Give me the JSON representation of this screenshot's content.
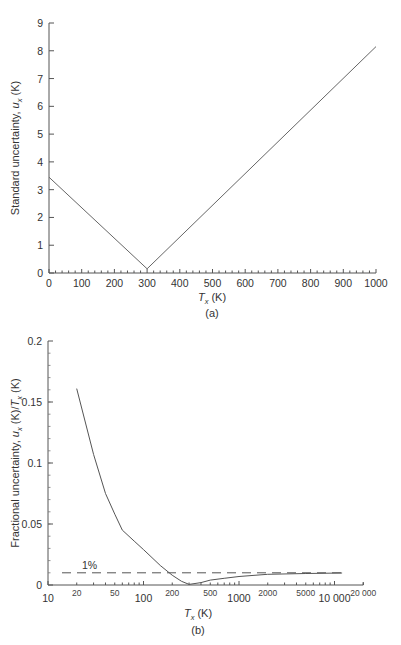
{
  "chart_data": [
    {
      "id": "a",
      "type": "line",
      "title": "",
      "caption": "(a)",
      "xlabel": "T_x (K)",
      "xlabel_var": "T",
      "xlabel_sub": "x",
      "xlabel_unit": " (K)",
      "ylabel": "Standard uncertainty, u_x (K)",
      "ylabel_prefix": "Standard uncertainty, ",
      "ylabel_var": "u",
      "ylabel_sub": "x",
      "ylabel_unit": " (K)",
      "xscale": "linear",
      "xlim": [
        0,
        1000
      ],
      "ylim": [
        0,
        9
      ],
      "xticks": [
        0,
        100,
        200,
        300,
        400,
        500,
        600,
        700,
        800,
        900,
        1000
      ],
      "yticks": [
        0,
        1,
        2,
        3,
        4,
        5,
        6,
        7,
        8,
        9
      ],
      "grid": false,
      "legend": null,
      "series": [
        {
          "name": "u_x",
          "x": [
            0,
            300,
            1000
          ],
          "y": [
            3.45,
            0.15,
            8.15
          ]
        }
      ]
    },
    {
      "id": "b",
      "type": "line",
      "title": "",
      "caption": "(b)",
      "xlabel": "T_x (K)",
      "xlabel_var": "T",
      "xlabel_sub": "x",
      "xlabel_unit": " (K)",
      "ylabel": "Fractional uncertainty, u_x (K)/T_x (K)",
      "ylabel_prefix": "Fractional uncertainty, ",
      "ylabel_var1": "u",
      "ylabel_sub1": "x",
      "ylabel_mid": " (K)/",
      "ylabel_var2": "T",
      "ylabel_sub2": "x",
      "ylabel_unit": " (K)",
      "xscale": "log",
      "xlim": [
        10,
        20000
      ],
      "ylim": [
        0,
        0.2
      ],
      "xticks_major": [
        10,
        100,
        1000,
        10000
      ],
      "xticks_major_labels": [
        "10",
        "100",
        "1000",
        "10 000"
      ],
      "xticks_minor_labeled": [
        20,
        50,
        200,
        500,
        2000,
        5000,
        20000
      ],
      "xticks_minor_labels": [
        "20",
        "50",
        "200",
        "500",
        "2000",
        "5000",
        "20 000"
      ],
      "yticks": [
        0,
        0.05,
        0.1,
        0.15,
        0.2
      ],
      "ytick_labels": [
        "0",
        "0.05",
        "0.1",
        "0.15",
        "0.2"
      ],
      "grid": false,
      "legend": null,
      "annotations": [
        {
          "text": "1%",
          "type": "hline",
          "y": 0.01,
          "style": "dashed"
        }
      ],
      "series": [
        {
          "name": "u_x / T_x",
          "x": [
            20,
            30,
            40,
            50,
            60,
            80,
            100,
            150,
            200,
            250,
            300,
            400,
            500,
            700,
            1000,
            2000,
            5000,
            12000
          ],
          "y": [
            0.161,
            0.107,
            0.075,
            0.058,
            0.045,
            0.036,
            0.029,
            0.016,
            0.008,
            0.003,
            0.0005,
            0.002,
            0.004,
            0.0055,
            0.007,
            0.0088,
            0.0094,
            0.0098
          ]
        }
      ]
    }
  ],
  "labels": {
    "a_caption": "(a)",
    "b_caption": "(b)",
    "one_percent": "1%"
  }
}
